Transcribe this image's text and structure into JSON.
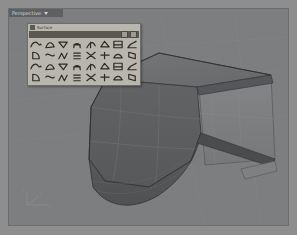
{
  "app": {
    "name": "Rhino 3D Viewport",
    "artifact_text": "- - - - -"
  },
  "viewport": {
    "title": "Perspective",
    "title_dropdown_icon": "chevron-down-icon",
    "display_mode": "Shaded",
    "background_color": "#7c7e80",
    "grid_color": "#898b8d",
    "surface_fill_dark": "#5f6163",
    "surface_fill_mid": "#6c6e70",
    "surface_fill_light": "#7b7d7f",
    "edge_color": "#3a3c3e"
  },
  "gizmo": {
    "name": "axis-indicator",
    "x_label": "x",
    "y_label": "y",
    "z_label": "z"
  },
  "palette": {
    "title": "Surface",
    "grip_icon": "drag-grip-icon",
    "close_icon": "close-icon",
    "minimize_icon": "minimize-icon",
    "rows": 4,
    "cols": 8,
    "tools": [
      {
        "id": "loft",
        "label": "Loft"
      },
      {
        "id": "sweep1",
        "label": "Sweep 1 Rail"
      },
      {
        "id": "sweep2",
        "label": "Sweep 2 Rails"
      },
      {
        "id": "revolve",
        "label": "Revolve"
      },
      {
        "id": "rail-revolve",
        "label": "Rail Revolve"
      },
      {
        "id": "network",
        "label": "Surface from Network of Curves"
      },
      {
        "id": "corner-points",
        "label": "Surface from Corner Points"
      },
      {
        "id": "planar-curves",
        "label": "Surface from Planar Curves"
      },
      {
        "id": "patch",
        "label": "Patch"
      },
      {
        "id": "drape",
        "label": "Drape"
      },
      {
        "id": "heightfield",
        "label": "Heightfield from Image"
      },
      {
        "id": "fillet-surface",
        "label": "Fillet Surface"
      },
      {
        "id": "blend-surface",
        "label": "Blend Surface"
      },
      {
        "id": "chamfer-surface",
        "label": "Chamfer Surface"
      },
      {
        "id": "extrude-straight",
        "label": "Extrude Straight"
      },
      {
        "id": "extrude-tapered",
        "label": "Extrude Tapered"
      },
      {
        "id": "extrude-to-point",
        "label": "Extrude to Point"
      },
      {
        "id": "extrude-along-curve",
        "label": "Extrude Along Curve"
      },
      {
        "id": "offset-surface",
        "label": "Offset Surface"
      },
      {
        "id": "untrim",
        "label": "Untrim"
      },
      {
        "id": "split-surface",
        "label": "Split Surface by Isocurve"
      },
      {
        "id": "merge-surface",
        "label": "Merge Surfaces"
      },
      {
        "id": "join-surface",
        "label": "Join Surfaces"
      },
      {
        "id": "match-surface",
        "label": "Match Surface"
      },
      {
        "id": "unroll",
        "label": "Unroll Developable Surface"
      },
      {
        "id": "smash",
        "label": "Smash"
      },
      {
        "id": "rebuild-surface",
        "label": "Rebuild Surface"
      },
      {
        "id": "shrink-surface",
        "label": "Shrink Trimmed Surface"
      },
      {
        "id": "surface-box",
        "label": "Surface Box"
      },
      {
        "id": "surface-cylinder",
        "label": "Surface Cylinder"
      },
      {
        "id": "surface-sphere",
        "label": "Surface Sphere"
      },
      {
        "id": "surface-curve",
        "label": "Surface Curve"
      }
    ]
  }
}
